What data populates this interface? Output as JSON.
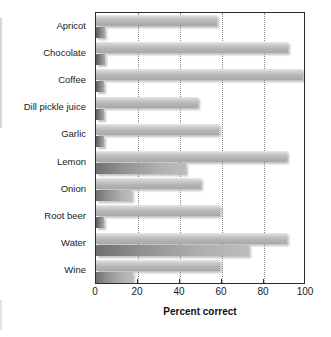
{
  "chart_data": {
    "type": "bar",
    "title": "",
    "xlabel": "Percent correct",
    "ylabel": "",
    "xlim": [
      0,
      100
    ],
    "ylim": null,
    "orientation": "horizontal",
    "grid": "vertical-dotted",
    "legend": "none",
    "xticks": [
      0,
      20,
      40,
      60,
      80,
      100
    ],
    "xtick_labels": [
      "0",
      "20",
      "40",
      "60",
      "80",
      "100"
    ],
    "categories": [
      "Apricot",
      "Chocolate",
      "Coffee",
      "Dill pickle juice",
      "Garlic",
      "Lemon",
      "Onion",
      "Root beer",
      "Water",
      "Wine"
    ],
    "series": [
      {
        "name": "upper-bar",
        "values": [
          57.5,
          91.5,
          98.5,
          48.5,
          58.5,
          91.0,
          50.0,
          59.0,
          91.0,
          59.0
        ]
      },
      {
        "name": "lower-bar",
        "values": [
          4.5,
          4.5,
          4.0,
          4.0,
          4.0,
          43.0,
          17.0,
          4.0,
          73.0,
          17.5
        ]
      }
    ]
  },
  "axis": {
    "x_title": "Percent correct"
  }
}
